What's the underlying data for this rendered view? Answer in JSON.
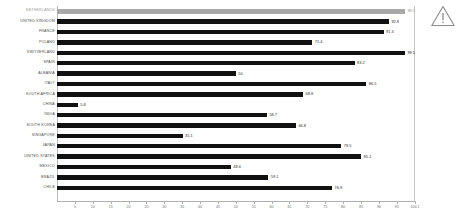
{
  "chart_data": {
    "type": "bar",
    "orientation": "horizontal",
    "title": "",
    "xlabel": "",
    "ylabel": "",
    "xlim": [
      0,
      100.1
    ],
    "grid": false,
    "legend": null,
    "categories": [
      "NETHERLANDS",
      "UNITED KINGDOM",
      "FRANCE",
      "POLAND",
      "SWITZERLAND",
      "SPAIN",
      "ALBANIA",
      "ITALY",
      "SOUTH AFRICA",
      "CHINA",
      "INDIA",
      "SOUTH KOREA",
      "SINGAPORE",
      "JAPAN",
      "UNITED STATES",
      "MEXICO",
      "BRAZIL",
      "CHILE"
    ],
    "values": [
      99.1,
      92.8,
      91.3,
      71.4,
      99.5,
      83.2,
      50,
      86.5,
      68.8,
      5.8,
      58.7,
      66.8,
      35.1,
      79.5,
      85.1,
      48.6,
      59.1,
      76.9
    ],
    "value_labels": [
      "99.1",
      "92.8",
      "91.3",
      "71.4",
      "99.5",
      "83.2",
      "50",
      "86.5",
      "68.8",
      "5.8",
      "58.7",
      "66.8",
      "35.1",
      "79.5",
      "85.1",
      "48.6",
      "59.1",
      "76.9"
    ],
    "highlight_index": 0,
    "xticks": [
      5,
      10,
      15,
      20,
      25,
      30,
      35,
      40,
      45,
      50,
      55,
      60,
      65,
      70,
      75,
      80,
      85,
      90,
      95,
      100.1
    ],
    "xtick_labels": [
      "5",
      "10",
      "15",
      "20",
      "25",
      "30",
      "35",
      "40",
      "45",
      "50",
      "55",
      "60",
      "65",
      "70",
      "75",
      "80",
      "85",
      "90",
      "95",
      "100.1"
    ],
    "colors": {
      "bar": "#111111",
      "highlight_bar": "#a8a8a8",
      "axis": "#b0b0b0",
      "label_text": "#4a4a4a",
      "highlight_text": "#9a9a9a"
    }
  },
  "icons": {
    "warning": "warning-triangle-icon"
  }
}
